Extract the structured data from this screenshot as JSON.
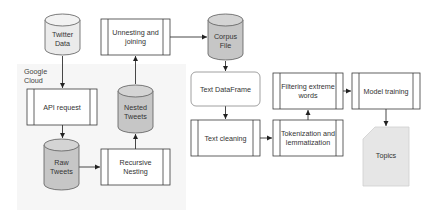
{
  "diagram": {
    "colors": {
      "stroke": "#4a4a4a",
      "cylinder_light": "#ebebeb",
      "cylinder_gray": "#c6c6c6",
      "group_bg": "#f7f7f7",
      "card_fill": "#e6e6e6",
      "box_fill": "#ffffff"
    },
    "group": {
      "label": "Google\nCloud"
    },
    "nodes": {
      "twitter_data": {
        "label": "Twitter\nData",
        "shape": "cylinder"
      },
      "api_request": {
        "label": "API request",
        "shape": "process"
      },
      "raw_tweets": {
        "label": "Raw\nTweets",
        "shape": "cylinder"
      },
      "recursive_nesting": {
        "label": "Recursive\nNesting",
        "shape": "process"
      },
      "nested_tweets": {
        "label": "Nested\nTweets",
        "shape": "cylinder"
      },
      "unnesting_joining": {
        "label": "Unnesting and\njoining",
        "shape": "process"
      },
      "corpus_file": {
        "label": "Corpus\nFile",
        "shape": "cylinder"
      },
      "text_dataframe": {
        "label": "Text DataFrame",
        "shape": "rounded-rect"
      },
      "text_cleaning": {
        "label": "Text cleaning",
        "shape": "process"
      },
      "tokenization": {
        "label": "Tokenization and\nlemmatization",
        "shape": "process"
      },
      "filtering": {
        "label": "Filtering extreme\nwords",
        "shape": "process"
      },
      "model_training": {
        "label": "Model training",
        "shape": "process"
      },
      "topics": {
        "label": "Topics",
        "shape": "card"
      }
    },
    "edges": [
      [
        "Twitter Data",
        "API request"
      ],
      [
        "API request",
        "Raw Tweets"
      ],
      [
        "Raw Tweets",
        "Recursive Nesting"
      ],
      [
        "Recursive Nesting",
        "Nested Tweets"
      ],
      [
        "Nested Tweets",
        "Unnesting and joining"
      ],
      [
        "Unnesting and joining",
        "Corpus File"
      ],
      [
        "Corpus File",
        "Text DataFrame"
      ],
      [
        "Text DataFrame",
        "Text cleaning"
      ],
      [
        "Text cleaning",
        "Tokenization and lemmatization"
      ],
      [
        "Tokenization and lemmatization",
        "Filtering extreme words"
      ],
      [
        "Filtering extreme words",
        "Model training"
      ],
      [
        "Model training",
        "Topics"
      ]
    ]
  }
}
